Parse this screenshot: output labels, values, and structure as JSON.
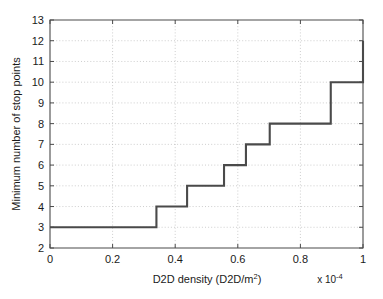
{
  "chart_data": {
    "type": "line",
    "subtype": "step-post",
    "title": "",
    "xlabel": "D2D density  (D2D/m2)",
    "xlabel_main": "D2D density  (D2D/m",
    "xlabel_sup": "2",
    "xlabel_tail": ")",
    "ylabel": "Minimum number of stop points",
    "x_multiplier_prefix": "x 10",
    "x_multiplier_exponent": "-4",
    "x_multiplier": "x 10^-4",
    "xlim": [
      0,
      1
    ],
    "ylim": [
      2,
      13
    ],
    "xticks": [
      0,
      0.2,
      0.4,
      0.6,
      0.8,
      1
    ],
    "xtick_labels": [
      "0",
      "0.2",
      "0.4",
      "0.6",
      "0.8",
      "1"
    ],
    "yticks": [
      2,
      3,
      4,
      5,
      6,
      7,
      8,
      9,
      10,
      11,
      12,
      13
    ],
    "ytick_labels": [
      "2",
      "3",
      "4",
      "5",
      "6",
      "7",
      "8",
      "9",
      "10",
      "11",
      "12",
      "13"
    ],
    "grid": true,
    "grid_style": "dotted",
    "legend": null,
    "legend_position": "none",
    "line_color": "#4a4a4a",
    "grid_color": "#b9b9b9",
    "axis_color": "#4a4a4a",
    "background_color": "#ffffff",
    "series": [
      {
        "name": "Minimum number of stop points",
        "x": [
          0,
          0.34,
          0.34,
          0.438,
          0.438,
          0.556,
          0.556,
          0.626,
          0.626,
          0.702,
          0.702,
          0.897,
          0.897,
          1,
          1
        ],
        "y": [
          3,
          3,
          4,
          4,
          5,
          5,
          6,
          6,
          7,
          7,
          8,
          8,
          10,
          10,
          12
        ]
      }
    ],
    "step_transitions": [
      {
        "x": 0.34,
        "from": 3,
        "to": 4
      },
      {
        "x": 0.438,
        "from": 4,
        "to": 5
      },
      {
        "x": 0.556,
        "from": 5,
        "to": 6
      },
      {
        "x": 0.626,
        "from": 6,
        "to": 7
      },
      {
        "x": 0.702,
        "from": 7,
        "to": 8
      },
      {
        "x": 0.897,
        "from": 8,
        "to": 10
      },
      {
        "x": 1.0,
        "from": 10,
        "to": 12
      }
    ]
  }
}
